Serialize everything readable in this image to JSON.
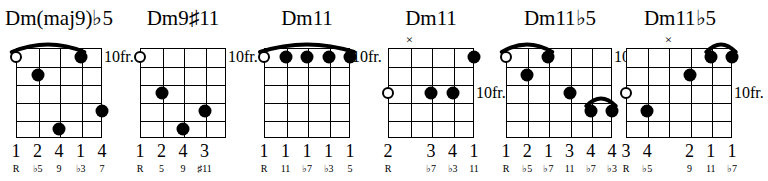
{
  "page": {
    "instrument": "guitar",
    "diagram_count": 6,
    "strings": 6,
    "frets": 5,
    "ink_color": "#000000",
    "background_color": "#ffffff"
  },
  "chords": [
    {
      "name": "Dm(maj9)♭5",
      "position_label": "10fr.",
      "position_row": 1,
      "strings_shown": 5,
      "fingers": [
        "1",
        "2",
        "4",
        "1",
        "4"
      ],
      "degrees": [
        "R",
        "♭5",
        "9",
        "♭3",
        "7"
      ],
      "markers": [],
      "open_strings": [
        1
      ],
      "dots": [
        {
          "string": 2,
          "fret": 2
        },
        {
          "string": 4,
          "fret": 1
        },
        {
          "string": 3,
          "fret": 5
        },
        {
          "string": 5,
          "fret": 4
        }
      ],
      "barres": [
        {
          "fret": 1,
          "from_string": 1,
          "to_string": 4
        }
      ]
    },
    {
      "name": "Dm9♯11",
      "position_label": "10fr.",
      "position_row": 1,
      "strings_shown": 5,
      "fingers": [
        "1",
        "2",
        "4",
        "3"
      ],
      "degrees": [
        "R",
        "5",
        "9",
        "♯11"
      ],
      "markers": [],
      "open_strings": [
        1
      ],
      "dots": [
        {
          "string": 2,
          "fret": 3
        },
        {
          "string": 4,
          "fret": 4
        },
        {
          "string": 3,
          "fret": 5
        }
      ],
      "barres": []
    },
    {
      "name": "Dm11",
      "position_label": "10fr.",
      "position_row": 1,
      "strings_shown": 5,
      "fingers": [
        "1",
        "1",
        "1",
        "1",
        "1"
      ],
      "degrees": [
        "R",
        "11",
        "♭7",
        "♭3",
        "5"
      ],
      "markers": [],
      "open_strings": [
        1
      ],
      "dots": [
        {
          "string": 2,
          "fret": 1
        },
        {
          "string": 3,
          "fret": 1
        },
        {
          "string": 4,
          "fret": 1
        },
        {
          "string": 5,
          "fret": 1
        }
      ],
      "barres": [
        {
          "fret": 1,
          "from_string": 1,
          "to_string": 5
        }
      ]
    },
    {
      "name": "Dm11",
      "position_label": "10fr.",
      "position_row": 3,
      "strings_shown": 5,
      "fingers": [
        "2",
        "",
        "3",
        "4",
        "1"
      ],
      "degrees": [
        "R",
        "",
        "♭7",
        "♭3",
        "11"
      ],
      "markers": [
        {
          "string": 2,
          "symbol": "×"
        }
      ],
      "open_strings": [
        1
      ],
      "dots": [
        {
          "string": 5,
          "fret": 1
        },
        {
          "string": 3,
          "fret": 3
        },
        {
          "string": 4,
          "fret": 3
        }
      ],
      "barres": []
    },
    {
      "name": "Dm11♭5",
      "position_label": "10fr.",
      "position_row": 1,
      "strings_shown": 6,
      "fingers": [
        "1",
        "2",
        "1",
        "3",
        "4",
        "4"
      ],
      "degrees": [
        "R",
        "♭5",
        "♭7",
        "11",
        "♭7",
        "♭3"
      ],
      "markers": [],
      "open_strings": [
        1
      ],
      "dots": [
        {
          "string": 3,
          "fret": 1
        },
        {
          "string": 2,
          "fret": 2
        },
        {
          "string": 4,
          "fret": 3
        },
        {
          "string": 5,
          "fret": 4
        },
        {
          "string": 6,
          "fret": 4
        }
      ],
      "barres": [
        {
          "fret": 1,
          "from_string": 1,
          "to_string": 3
        },
        {
          "fret": 4,
          "from_string": 5,
          "to_string": 6
        }
      ]
    },
    {
      "name": "Dm11♭5",
      "position_label": "10fr.",
      "position_row": 3,
      "strings_shown": 6,
      "fingers": [
        "3",
        "4",
        "",
        "2",
        "1",
        "1"
      ],
      "degrees": [
        "R",
        "♭5",
        "",
        "9",
        "11",
        "♭7"
      ],
      "markers": [
        {
          "string": 3,
          "symbol": "×"
        }
      ],
      "open_strings": [
        1
      ],
      "dots": [
        {
          "string": 2,
          "fret": 4
        },
        {
          "string": 4,
          "fret": 2
        },
        {
          "string": 5,
          "fret": 1
        },
        {
          "string": 6,
          "fret": 1
        }
      ],
      "barres": [
        {
          "fret": 1,
          "from_string": 5,
          "to_string": 6
        }
      ]
    }
  ]
}
